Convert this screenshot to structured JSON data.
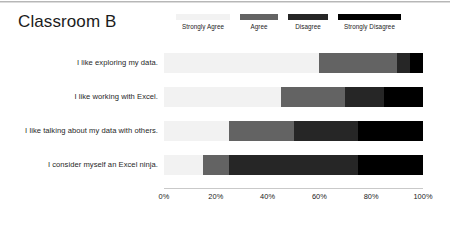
{
  "title": "Classroom B",
  "legend": {
    "position": "top-right",
    "entries": [
      {
        "label": "Strongly Agree",
        "color": "#F2F2F2",
        "width_px": 54
      },
      {
        "label": "Agree",
        "color": "#636363",
        "width_px": 38
      },
      {
        "label": "Disagree",
        "color": "#262626",
        "width_px": 40
      },
      {
        "label": "Strongly Disagree",
        "color": "#000000",
        "width_px": 63
      }
    ]
  },
  "axis": {
    "ticks": [
      "0%",
      "20%",
      "40%",
      "60%",
      "80%",
      "100%"
    ],
    "tick_values": [
      0,
      20,
      40,
      60,
      80,
      100
    ]
  },
  "chart_data": {
    "type": "bar",
    "orientation": "horizontal",
    "stacked": true,
    "title": "Classroom B",
    "xlabel": "",
    "ylabel": "",
    "xlim": [
      0,
      100
    ],
    "grid": false,
    "legend_position": "top-right",
    "categories": [
      "I like exploring my data.",
      "I like working with Excel.",
      "I like talking about my data with others.",
      "I consider myself an Excel ninja."
    ],
    "series": [
      {
        "name": "Strongly Agree",
        "color": "#F2F2F2",
        "values": [
          60,
          45,
          25,
          15
        ]
      },
      {
        "name": "Agree",
        "color": "#636363",
        "values": [
          30,
          25,
          25,
          10
        ]
      },
      {
        "name": "Disagree",
        "color": "#262626",
        "values": [
          5,
          15,
          25,
          50
        ]
      },
      {
        "name": "Strongly Disagree",
        "color": "#000000",
        "values": [
          5,
          15,
          25,
          25
        ]
      }
    ]
  }
}
